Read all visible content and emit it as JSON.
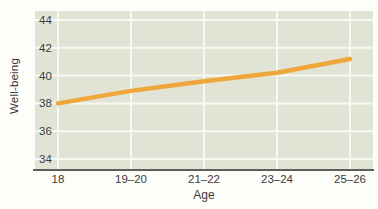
{
  "figure": {
    "x_axis_title": "Age",
    "y_axis_title": "Well-being"
  },
  "chart_data": {
    "type": "line",
    "title": "",
    "xlabel": "Age",
    "ylabel": "Well-being",
    "categories": [
      "18",
      "19–20",
      "21–22",
      "23–24",
      "25–26"
    ],
    "values": [
      38.0,
      38.9,
      39.6,
      40.2,
      41.2
    ],
    "series_name": "Well-being",
    "yticks": [
      44,
      42,
      40,
      38,
      36,
      34
    ],
    "ylim": [
      33.2,
      44.7
    ],
    "grid": true,
    "legend": "none",
    "line_color": "#efa63a",
    "plot_bg_color": "#e1e4d4",
    "gridline_color": "#f8f8f2",
    "axis_line_color": "#5e5e60",
    "text_color": "#3a3a3a"
  }
}
